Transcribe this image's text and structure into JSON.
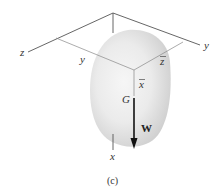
{
  "figure": {
    "caption": "(c)",
    "labels": {
      "z_axis": "z",
      "y_axis": "y",
      "x_axis": "x",
      "y_dim": "y",
      "z_bar": "z",
      "x_bar": "x",
      "center_of_gravity": "G",
      "weight": "W"
    },
    "colors": {
      "axis_line": "#555555",
      "thin_line": "#888888",
      "body_fill": "#e6e6e6",
      "weight_arrow": "#111111"
    }
  }
}
